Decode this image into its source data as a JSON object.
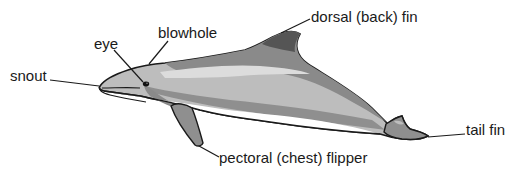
{
  "diagram": {
    "colors": {
      "outline": "#1a1a1a",
      "dark_back": "#5a5a5a",
      "mid_stripe": "#8a8a8a",
      "light_body": "#bdbdbd",
      "pale_stripe": "#d9d9d9",
      "belly": "#ffffff",
      "fin": "#8f8f8f"
    },
    "labels": [
      {
        "id": "snout",
        "text": "snout"
      },
      {
        "id": "eye",
        "text": "eye"
      },
      {
        "id": "blowhole",
        "text": "blowhole"
      },
      {
        "id": "dorsal-fin",
        "text": "dorsal (back) fin"
      },
      {
        "id": "tail-fin",
        "text": "tail fin"
      },
      {
        "id": "pectoral-flipper",
        "text": "pectoral (chest) flipper"
      }
    ]
  }
}
